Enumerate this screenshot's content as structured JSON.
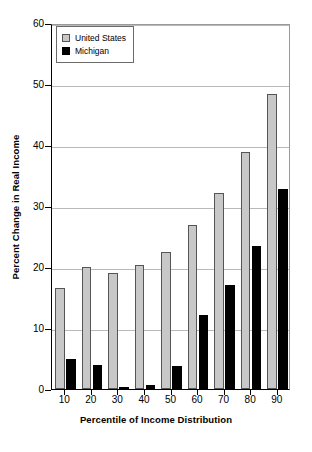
{
  "chart_data": {
    "type": "bar",
    "title": "",
    "xlabel": "Percentile of Income Distribution",
    "ylabel": "Percent Change in Real Income",
    "categories": [
      "10",
      "20",
      "30",
      "40",
      "50",
      "60",
      "70",
      "80",
      "90"
    ],
    "series": [
      {
        "name": "United States",
        "color": "#c8c8c8",
        "values": [
          16.5,
          20.0,
          19.0,
          20.3,
          22.4,
          26.9,
          32.2,
          38.9,
          48.3
        ]
      },
      {
        "name": "Michigan",
        "color": "#000000",
        "values": [
          5.0,
          4.0,
          0.3,
          0.7,
          3.8,
          12.1,
          17.1,
          23.5,
          32.8
        ]
      }
    ],
    "ylim": [
      0,
      60
    ],
    "yticks": [
      0,
      10,
      20,
      30,
      40,
      50,
      60
    ],
    "ytick_labels": [
      "0",
      "10",
      "20",
      "30",
      "40",
      "50",
      "60"
    ],
    "grid": "horizontal",
    "legend_position": "top-left"
  },
  "legend": {
    "items": [
      {
        "label": "United States",
        "swatch": "us"
      },
      {
        "label": "Michigan",
        "swatch": "mi"
      }
    ]
  }
}
